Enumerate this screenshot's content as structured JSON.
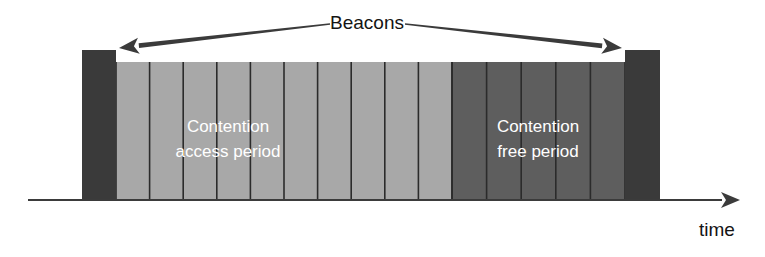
{
  "diagram": {
    "callout": {
      "label": "Beacons",
      "label_x": 367,
      "label_y": 24
    },
    "axis": {
      "label": "time",
      "label_x": 717,
      "label_y": 231,
      "line_y": 200,
      "line_x_start": 28,
      "line_x_end": 722,
      "arrow_tip_x": 740
    },
    "colors": {
      "beacon": "#3a3a3a",
      "contention_access": "#a8a8a8",
      "contention_free": "#5e5e5e",
      "slot_divider": "#2b2b2b",
      "line": "#3b3b3b",
      "label_text": "#ffffff",
      "annotation_text": "#141414",
      "background": "#ffffff"
    },
    "beacons": [
      {
        "name": "left-beacon",
        "x": 82,
        "y": 50,
        "width": 34,
        "height": 150
      },
      {
        "name": "right-beacon",
        "x": 625,
        "y": 50,
        "width": 35,
        "height": 150
      }
    ],
    "periods": [
      {
        "name": "contention-access-period",
        "label_line1": "Contention",
        "label_line2": "access period",
        "label_x": 228,
        "label_y1": 128,
        "label_y2": 153,
        "x": 116,
        "y": 62,
        "width": 336,
        "height": 138,
        "slots": 10,
        "fill": "#a8a8a8"
      },
      {
        "name": "contention-free-period",
        "label_line1": "Contention",
        "label_line2": "free period",
        "label_x": 538,
        "label_y1": 128,
        "label_y2": 153,
        "x": 452,
        "y": 62,
        "width": 173,
        "height": 138,
        "slots": 5,
        "fill": "#5e5e5e"
      }
    ],
    "arrows": [
      {
        "name": "beacons-arrow-left",
        "from_x": 330,
        "from_y": 24,
        "to_x": 119,
        "to_y": 48,
        "direction": "left"
      },
      {
        "name": "beacons-arrow-right",
        "from_x": 405,
        "from_y": 24,
        "to_x": 622,
        "to_y": 48,
        "direction": "right"
      }
    ]
  }
}
